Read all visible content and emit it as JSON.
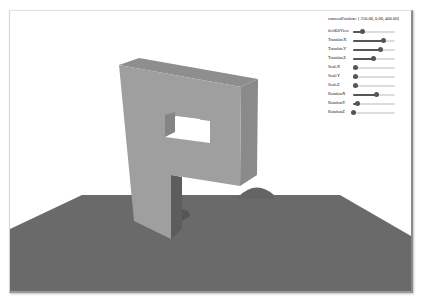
{
  "camera": {
    "label": "cameraPosition:",
    "value": "[ 250.00, 0.00, 400.00]"
  },
  "controls": [
    {
      "label": "fieldOfView",
      "percent": 22
    },
    {
      "label": "TranslateX",
      "percent": 72
    },
    {
      "label": "TranslateY",
      "percent": 66
    },
    {
      "label": "TranslateZ",
      "percent": 48
    },
    {
      "label": "ScaleX",
      "percent": 6
    },
    {
      "label": "ScaleY",
      "percent": 6
    },
    {
      "label": "ScaleZ",
      "percent": 6
    },
    {
      "label": "RotationX",
      "percent": 56
    },
    {
      "label": "RotationY",
      "percent": 10
    },
    {
      "label": "RotationZ",
      "percent": 2
    }
  ],
  "scene": {
    "object": "extruded-letter-P",
    "ground": "plane",
    "sphere": "sphere",
    "colors": {
      "front_face": "#9d9d9d",
      "top_face": "#8f8f8f",
      "side_face": "#8a8a8a",
      "inner_face": "#7e7e7e",
      "shadow": "#5a5a5a",
      "ground": "#6a6a6a",
      "background": "#ffffff"
    }
  }
}
